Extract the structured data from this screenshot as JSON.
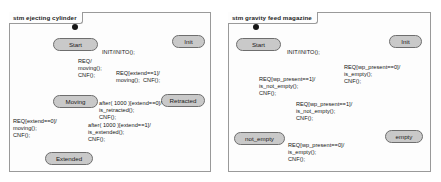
{
  "diagrams": [
    {
      "title": "stm ejecting cylinder",
      "states": [
        {
          "name": "Start"
        },
        {
          "name": "Init"
        },
        {
          "name": "Moving"
        },
        {
          "name": "Retracted"
        },
        {
          "name": "Extended"
        }
      ],
      "initial_pseudostate": "filled-circle",
      "transitions": [
        {
          "from": "initial",
          "to": "Start",
          "label": ""
        },
        {
          "from": "Start",
          "to": "Init",
          "label": "INIT/INITO();"
        },
        {
          "from": "Init",
          "to": "Start",
          "label": ""
        },
        {
          "from": "Start",
          "to": "Moving",
          "label": "REQ/\nmoving();\nCNF();"
        },
        {
          "from": "Retracted",
          "to": "Moving",
          "label": "REQ[extend==1]/\nmoving();  CNF();"
        },
        {
          "from": "Moving",
          "to": "Retracted",
          "label": "after( 1000 )[extend==0]/\nis_retracted();\nCNF();"
        },
        {
          "from": "Moving",
          "to": "Extended",
          "label": "after( 1000 )[extend==1]/\nis_extended();\nCNF();"
        },
        {
          "from": "Extended",
          "to": "Moving",
          "label": "REQ[extend==0]/\nmoving();\nCNF();"
        }
      ],
      "labels": {
        "init_transition": "INIT/INITO();",
        "start_to_moving": "REQ/\nmoving();\nCNF();",
        "retracted_to_moving": "REQ[extend==1]/\nmoving();  CNF();",
        "moving_to_retracted": "after( 1000 )[extend==0]/\nis_retracted();\nCNF();",
        "moving_to_extended": "after( 1000 )[extend==1]/\nis_extended();\nCNF();",
        "extended_to_moving": "REQ[extend==0]/\nmoving();\nCNF();"
      }
    },
    {
      "title": "stm gravity feed magazine",
      "states": [
        {
          "name": "Start"
        },
        {
          "name": "Init"
        },
        {
          "name": "not_empty"
        },
        {
          "name": "empty"
        }
      ],
      "initial_pseudostate": "filled-circle",
      "transitions": [
        {
          "from": "initial",
          "to": "Start",
          "label": ""
        },
        {
          "from": "Start",
          "to": "Init",
          "label": "INIT/INITO();"
        },
        {
          "from": "Init",
          "to": "Start",
          "label": ""
        },
        {
          "from": "Start",
          "to": "not_empty",
          "label": "REQ[wp_present==1]/\nis_not_empty();\nCNF();"
        },
        {
          "from": "Start",
          "to": "empty",
          "label": "REQ[wp_present==0]/\nis_empty();\nCNF();"
        },
        {
          "from": "empty",
          "to": "not_empty",
          "label": "REQ[wp_present==1]/\nis_not_empty();\nCNF();"
        },
        {
          "from": "not_empty",
          "to": "empty",
          "label": "REQ[wp_present==0]/\nis_empty();\nCNF();"
        }
      ],
      "labels": {
        "init_transition": "INIT/INITO();",
        "start_to_not_empty": "REQ[wp_present==1]/\nis_not_empty();\nCNF();",
        "start_to_empty": "REQ[wp_present==0]/\nis_empty();\nCNF();",
        "empty_to_not_empty": "REQ[wp_present==1]/\nis_not_empty();\nCNF();",
        "not_empty_to_empty": "REQ[wp_present==0]/\nis_empty();\nCNF();"
      }
    }
  ],
  "colors": {
    "state_fill": "#c9c9c9",
    "state_stroke": "#6e6e6e",
    "frame_stroke": "#9a9a9a",
    "edge_stroke": "#8a8a8a",
    "text": "#141414",
    "background": "#ffffff",
    "initial_node": "#161616"
  }
}
